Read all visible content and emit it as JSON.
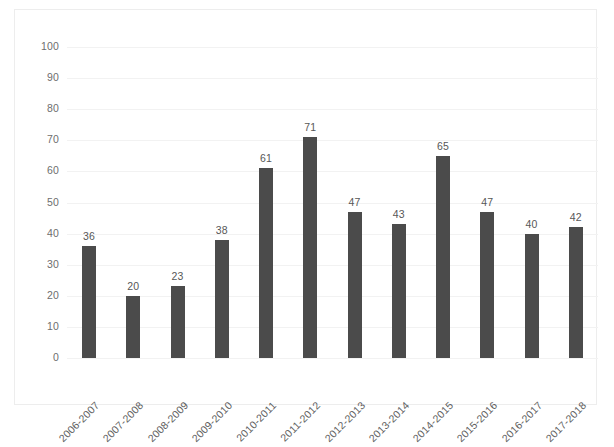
{
  "chart_data": {
    "type": "bar",
    "title": "",
    "subtitle": "",
    "xlabel": "",
    "ylabel": "",
    "ylim": [
      0,
      100
    ],
    "ytick_step": 10,
    "yticks": [
      100,
      90,
      80,
      70,
      60,
      50,
      40,
      30,
      20,
      10,
      0
    ],
    "grid": true,
    "legend": false,
    "legend_position": "none",
    "categories": [
      "2006-2007",
      "2007-2008",
      "2008-2009",
      "2009-2010",
      "2010-2011",
      "2011-2012",
      "2012-2013",
      "2013-2014",
      "2014-2015",
      "2015-2016",
      "2016-2017",
      "2017-2018"
    ],
    "values": [
      36,
      20,
      23,
      38,
      61,
      71,
      47,
      43,
      65,
      47,
      40,
      42
    ],
    "data_labels": [
      "36",
      "20",
      "23",
      "38",
      "61",
      "71",
      "47",
      "43",
      "65",
      "47",
      "40",
      "42"
    ],
    "bar_color": "#4b4b4b",
    "gridline_color": "#f2f2f2",
    "axis_text_color": "#6e6e6e",
    "border_color": "#ededed",
    "background_color": "#ffffff"
  }
}
